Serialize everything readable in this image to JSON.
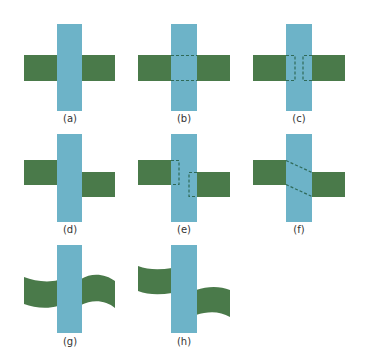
{
  "colors": {
    "vertical_bar": "#6DB3C8",
    "horizontal_bar": "#4A7A4A",
    "dashed_line": "#2F6A58",
    "label_text": "#333333",
    "background": "#FFFFFF"
  },
  "panels": [
    {
      "id": "a",
      "label": "(a)",
      "description": "Straight horizontal bar passing behind vertical bar"
    },
    {
      "id": "b",
      "label": "(b)",
      "description": "Horizontal bar with dashed horizontal edges continued across vertical bar"
    },
    {
      "id": "c",
      "label": "(c)",
      "description": "Horizontal bar ends with dashed brackets meeting behind vertical bar"
    },
    {
      "id": "d",
      "label": "(d)",
      "description": "Horizontal bar segments vertically offset on either side of vertical bar"
    },
    {
      "id": "e",
      "label": "(e)",
      "description": "Offset segments with dashed bracket terminations behind vertical bar"
    },
    {
      "id": "f",
      "label": "(f)",
      "description": "Offset segments connected by diagonal dashed lines behind vertical bar"
    },
    {
      "id": "g",
      "label": "(g)",
      "description": "Wavy ribbon aligned across vertical bar"
    },
    {
      "id": "h",
      "label": "(h)",
      "description": "Wavy ribbon segments offset across vertical bar"
    }
  ]
}
